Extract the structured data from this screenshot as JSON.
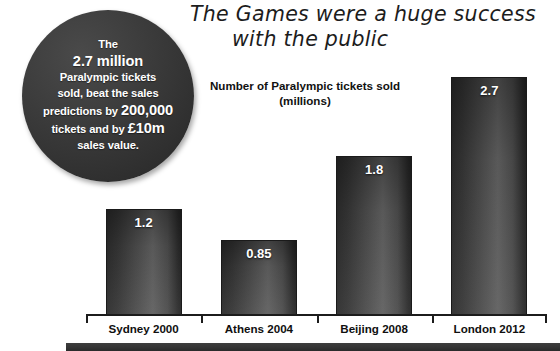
{
  "headline": {
    "line1": "The Games were a huge success",
    "line2": "with the public"
  },
  "badge": {
    "line1": "The",
    "line2": "2.7 million",
    "line3": "Paralympic tickets",
    "line4": "sold, beat the sales",
    "line5_a": "predictions by ",
    "line5_b": "200,000",
    "line6_a": "tickets and by ",
    "line6_b": "£10m",
    "line7": "sales value.",
    "background_color": "#333333",
    "text_color": "#ffffff"
  },
  "chart_data": {
    "type": "bar",
    "title": "Number of Paralympic tickets sold",
    "subtitle": "(millions)",
    "categories": [
      "Sydney 2000",
      "Athens 2004",
      "Beijing 2008",
      "London 2012"
    ],
    "values": [
      1.2,
      0.85,
      1.8,
      2.7
    ],
    "value_labels": [
      "1.2",
      "0.85",
      "1.8",
      "2.7"
    ],
    "xlabel": "",
    "ylabel": "",
    "ylim": [
      0,
      2.7
    ],
    "grid": false,
    "legend": "none",
    "bar_color": "#444444",
    "value_label_color": "#ffffff",
    "axis_color": "#1c1c1c"
  }
}
